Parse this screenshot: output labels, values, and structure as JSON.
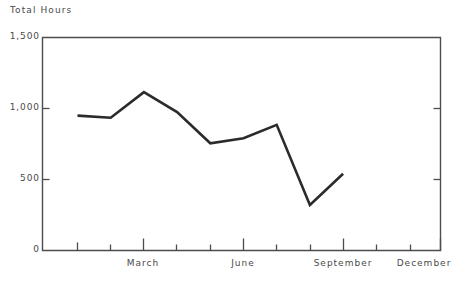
{
  "chart_data": {
    "type": "line",
    "title": "Total Hours",
    "xlabel": "",
    "ylabel": "Total Hours",
    "ylim": [
      0,
      1500
    ],
    "yticks": [
      0,
      500,
      1000,
      1500
    ],
    "ytick_labels": [
      "0",
      "500",
      "1,000",
      "1,500"
    ],
    "grid": false,
    "legend_position": "none",
    "categories": [
      "January",
      "February",
      "March",
      "April",
      "May",
      "June",
      "July",
      "August",
      "September",
      "October",
      "November",
      "December"
    ],
    "xtick_labels_shown": [
      "March",
      "June",
      "September",
      "December"
    ],
    "series": [
      {
        "name": "Total Hours",
        "color": "#2b2b2b",
        "x": [
          "January",
          "February",
          "March",
          "April",
          "May",
          "June",
          "July",
          "August",
          "September"
        ],
        "values": [
          950,
          935,
          1115,
          975,
          755,
          790,
          885,
          320,
          540
        ]
      }
    ],
    "annotations": []
  },
  "axis": {
    "title": "Total Hours",
    "y_labels": [
      "1,500",
      "1,000",
      "500",
      "0"
    ],
    "x_labels": [
      "March",
      "June",
      "September",
      "December"
    ]
  },
  "colors": {
    "line": "#2b2b2b",
    "frame": "#4d4d4d",
    "text": "#4a4a4a",
    "background": "#ffffff"
  }
}
